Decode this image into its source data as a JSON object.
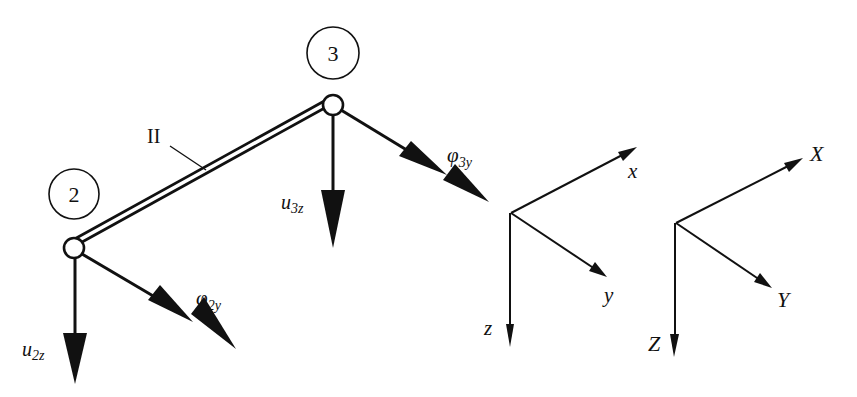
{
  "diagram": {
    "type": "structural-frame-element-dofs",
    "colors": {
      "ink": "#111111",
      "background": "#ffffff"
    },
    "element": {
      "label": "II",
      "from_node": "2",
      "to_node": "3"
    },
    "nodes": [
      {
        "id": "2",
        "label": "2"
      },
      {
        "id": "3",
        "label": "3"
      }
    ],
    "dofs": [
      {
        "name": "u",
        "sub": "2z",
        "kind": "translation"
      },
      {
        "name": "φ",
        "sub": "2y",
        "kind": "rotation"
      },
      {
        "name": "u",
        "sub": "3z",
        "kind": "translation"
      },
      {
        "name": "φ",
        "sub": "3y",
        "kind": "rotation"
      }
    ],
    "local_axes": {
      "x": "x",
      "y": "y",
      "z": "z"
    },
    "global_axes": {
      "x": "X",
      "y": "Y",
      "z": "Z"
    }
  }
}
